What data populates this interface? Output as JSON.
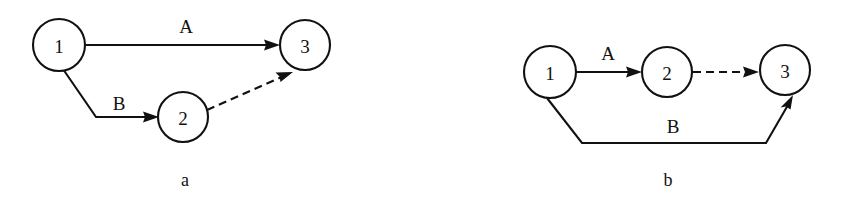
{
  "figure": {
    "background_color": "#ffffff",
    "stroke_color": "#111111",
    "panels": [
      {
        "id": "panel-a",
        "caption": "a",
        "caption_pos": {
          "x": 185,
          "y": 186
        },
        "nodes": [
          {
            "id": "a-node-1",
            "label": "1",
            "cx": 59,
            "cy": 45,
            "r": 26
          },
          {
            "id": "a-node-2",
            "label": "2",
            "cx": 183,
            "cy": 117,
            "r": 25
          },
          {
            "id": "a-node-3",
            "label": "3",
            "cx": 305,
            "cy": 45,
            "r": 25
          }
        ],
        "edges": [
          {
            "id": "a-edge-A",
            "label": "A",
            "from": "1",
            "to": "3",
            "style": "solid",
            "arrow": true,
            "label_pos": {
              "x": 186,
              "y": 33
            },
            "path": "M 85.5 45 L 272 45"
          },
          {
            "id": "a-edge-B",
            "label": "B",
            "from": "1",
            "to": "2",
            "style": "solid",
            "arrow": true,
            "label_pos": {
              "x": 119,
              "y": 110
            },
            "path": "M 64 70.5 L 96 117 L 151 117"
          },
          {
            "id": "a-edge-dashed",
            "label": "",
            "from": "2",
            "to": "3",
            "style": "dashed",
            "arrow": true,
            "label_pos": null,
            "path": "M 207 110 L 288 74"
          }
        ]
      },
      {
        "id": "panel-b",
        "caption": "b",
        "caption_pos": {
          "x": 668,
          "y": 186
        },
        "nodes": [
          {
            "id": "b-node-1",
            "label": "1",
            "cx": 550,
            "cy": 72,
            "r": 26
          },
          {
            "id": "b-node-2",
            "label": "2",
            "cx": 667,
            "cy": 72,
            "r": 25
          },
          {
            "id": "b-node-3",
            "label": "3",
            "cx": 785,
            "cy": 70,
            "r": 25
          }
        ],
        "edges": [
          {
            "id": "b-edge-A",
            "label": "A",
            "from": "1",
            "to": "2",
            "style": "solid",
            "arrow": true,
            "label_pos": {
              "x": 608,
              "y": 60
            },
            "path": "M 576.5 72 L 634 72"
          },
          {
            "id": "b-edge-dashed",
            "label": "",
            "from": "2",
            "to": "3",
            "style": "dashed",
            "arrow": true,
            "label_pos": null,
            "path": "M 693 72 L 752 72"
          },
          {
            "id": "b-edge-B",
            "label": "B",
            "from": "1",
            "to": "3",
            "style": "solid",
            "arrow": true,
            "label_pos": {
              "x": 673,
              "y": 133
            },
            "path": "M 547 98 L 582 143 L 766 143 L 791 100"
          }
        ]
      }
    ]
  }
}
